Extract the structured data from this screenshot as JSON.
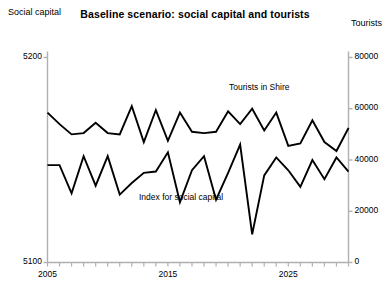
{
  "chart_data": {
    "type": "line",
    "title": "Baseline scenario: social capital and tourists",
    "xlabel": "",
    "ylabel_left": "Social capital",
    "ylabel_right": "Tourists",
    "ylim_left": [
      5100,
      5200
    ],
    "ylim_right": [
      0,
      80000
    ],
    "xlim": [
      2005,
      2030
    ],
    "grid": false,
    "legend_position": "inline-annotations",
    "left_axis_ticks": [
      "5100",
      "5200"
    ],
    "left_axis_tick_values": [
      5100,
      5200
    ],
    "right_axis_ticks": [
      "0",
      "20000",
      "40000",
      "60000",
      "80000"
    ],
    "right_axis_tick_values": [
      0,
      20000,
      40000,
      60000,
      80000
    ],
    "x_tick_labels": [
      "2005",
      "2015",
      "2025"
    ],
    "x_tick_label_values": [
      2005,
      2015,
      2025
    ],
    "x_minor_tick_values": [
      2005,
      2006,
      2007,
      2008,
      2009,
      2010,
      2011,
      2012,
      2013,
      2014,
      2015,
      2016,
      2017,
      2018,
      2019,
      2020,
      2021,
      2022,
      2023,
      2024,
      2025,
      2026,
      2027,
      2028,
      2029,
      2030
    ],
    "x": [
      2005,
      2006,
      2007,
      2008,
      2009,
      2010,
      2011,
      2012,
      2013,
      2014,
      2015,
      2016,
      2017,
      2018,
      2019,
      2020,
      2021,
      2022,
      2023,
      2024,
      2025,
      2026,
      2027,
      2028,
      2029,
      2030
    ],
    "series": [
      {
        "name": "Tourists in Shire",
        "axis": "right",
        "color": "#000000",
        "values": [
          58500,
          54000,
          50000,
          50500,
          54500,
          50500,
          50000,
          61000,
          47000,
          59500,
          47500,
          58500,
          51000,
          50500,
          51000,
          59000,
          54000,
          60000,
          51500,
          58500,
          45500,
          46500,
          55500,
          47000,
          43500,
          52500
        ]
      },
      {
        "name": "Index for social capital",
        "axis": "right",
        "color": "#000000",
        "values": [
          38000,
          38000,
          27000,
          41500,
          30000,
          41500,
          26500,
          31000,
          35000,
          35500,
          43000,
          23500,
          36000,
          41500,
          24500,
          35000,
          46000,
          11000,
          34000,
          41000,
          36000,
          29500,
          40000,
          32500,
          41000,
          35500
        ]
      }
    ],
    "annotations": [
      {
        "text": "Tourists in Shire",
        "series": "Tourists in Shire"
      },
      {
        "text": "Index for social capital",
        "series": "Index for social capital"
      }
    ]
  }
}
